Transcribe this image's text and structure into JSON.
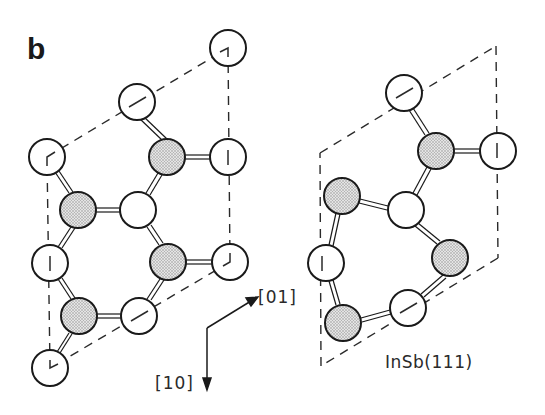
{
  "panel": {
    "label": "b"
  },
  "axes": {
    "dir_01": "[01]",
    "dir_10": "[10]"
  },
  "caption": "InSb(111)",
  "legend": {
    "shaded_atom": "shaded circle (stippled)",
    "open_atom": "open circle"
  },
  "colors": {
    "stroke": "#1a1a1a",
    "shade": "#cfcfcf",
    "background": "#ffffff"
  },
  "structures": {
    "left": {
      "description": "unreconstructed surface unit cell (dashed parallelogram) with atoms",
      "atoms": [
        {
          "x": 228,
          "y": 48,
          "type": "open",
          "mark": "corner"
        },
        {
          "x": 137,
          "y": 102,
          "type": "open",
          "mark": "slash"
        },
        {
          "x": 167,
          "y": 157,
          "type": "shaded"
        },
        {
          "x": 228,
          "y": 157,
          "type": "open",
          "mark": "vbar"
        },
        {
          "x": 47,
          "y": 157,
          "type": "open",
          "mark": "corner"
        },
        {
          "x": 78,
          "y": 210,
          "type": "shaded"
        },
        {
          "x": 138,
          "y": 210,
          "type": "open"
        },
        {
          "x": 50,
          "y": 263,
          "type": "open",
          "mark": "vbar"
        },
        {
          "x": 168,
          "y": 262,
          "type": "shaded"
        },
        {
          "x": 230,
          "y": 262,
          "type": "open",
          "mark": "corner"
        },
        {
          "x": 79,
          "y": 316,
          "type": "shaded"
        },
        {
          "x": 139,
          "y": 316,
          "type": "open",
          "mark": "slash"
        },
        {
          "x": 50,
          "y": 368,
          "type": "open",
          "mark": "corner"
        }
      ]
    },
    "right": {
      "description": "InSb(111) reconstructed cell",
      "atoms": [
        {
          "x": 404,
          "y": 93,
          "type": "open",
          "mark": "slash"
        },
        {
          "x": 436,
          "y": 151,
          "type": "shaded"
        },
        {
          "x": 498,
          "y": 151,
          "type": "open",
          "mark": "vbar"
        },
        {
          "x": 342,
          "y": 196,
          "type": "shaded"
        },
        {
          "x": 406,
          "y": 210,
          "type": "open"
        },
        {
          "x": 326,
          "y": 263,
          "type": "open",
          "mark": "vbar"
        },
        {
          "x": 450,
          "y": 258,
          "type": "shaded"
        },
        {
          "x": 408,
          "y": 308,
          "type": "open",
          "mark": "slash"
        },
        {
          "x": 343,
          "y": 323,
          "type": "shaded"
        }
      ]
    }
  }
}
